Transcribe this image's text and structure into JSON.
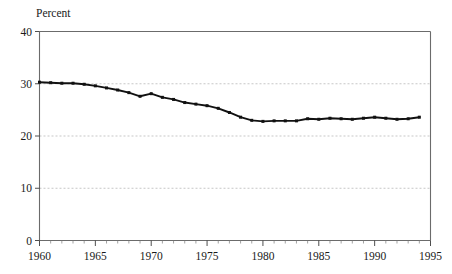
{
  "chart_data": {
    "type": "line",
    "title": "",
    "subtitle": "",
    "ylabel": "Percent",
    "xlabel": "",
    "ylim": [
      0,
      40
    ],
    "xlim": [
      1960,
      1995
    ],
    "y_ticks": [
      0,
      10,
      20,
      30,
      40
    ],
    "y_tick_labels": [
      "0",
      "10",
      "20",
      "30",
      "40"
    ],
    "x_ticks": [
      1960,
      1965,
      1970,
      1975,
      1980,
      1985,
      1990,
      1995
    ],
    "x_tick_labels": [
      "1960",
      "1965",
      "1970",
      "1975",
      "1980",
      "1985",
      "1990",
      "1995"
    ],
    "x_minor_tick_step": 1,
    "grid": "horizontal-dashed",
    "legend": "none",
    "marker": "square",
    "line_color": "#111111",
    "grid_color": "#b9b9b9",
    "frame_color": "#6b6b6b",
    "series": [
      {
        "name": "Percent",
        "x": [
          1960,
          1961,
          1962,
          1963,
          1964,
          1965,
          1966,
          1967,
          1968,
          1969,
          1970,
          1971,
          1972,
          1973,
          1974,
          1975,
          1976,
          1977,
          1978,
          1979,
          1980,
          1981,
          1982,
          1983,
          1984,
          1985,
          1986,
          1987,
          1988,
          1989,
          1990,
          1991,
          1992,
          1993,
          1994
        ],
        "values": [
          30.3,
          30.2,
          30.1,
          30.1,
          29.9,
          29.6,
          29.2,
          28.8,
          28.3,
          27.6,
          28.1,
          27.4,
          27.0,
          26.4,
          26.1,
          25.8,
          25.3,
          24.5,
          23.6,
          23.0,
          22.8,
          22.9,
          22.9,
          22.9,
          23.3,
          23.2,
          23.4,
          23.3,
          23.2,
          23.4,
          23.6,
          23.4,
          23.2,
          23.3,
          23.6
        ]
      }
    ]
  },
  "labels": {
    "y_axis_caption": "Percent"
  }
}
